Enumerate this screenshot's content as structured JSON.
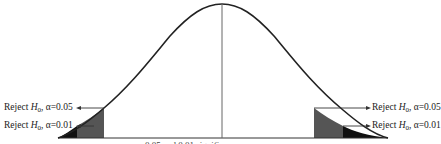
{
  "diagram": {
    "type": "normal-distribution-rejection-regions",
    "colors": {
      "curve": "#222222",
      "center_line": "#555555",
      "region_005": "#555555",
      "region_001": "#111111",
      "arrow": "#333333"
    },
    "left_labels": [
      {
        "prefix": "Reject ",
        "symbol": "H",
        "subscript": "0",
        "alpha_text": ", α=0.05"
      },
      {
        "prefix": "Reject ",
        "symbol": "H",
        "subscript": "0",
        "alpha_text": ", α=0.01"
      }
    ],
    "right_labels": [
      {
        "prefix": "Reject ",
        "symbol": "H",
        "subscript": "0",
        "alpha_text": ", α=0.05"
      },
      {
        "prefix": "Reject ",
        "symbol": "H",
        "subscript": "0",
        "alpha_text": ", α=0.01"
      }
    ],
    "caption_partial": "0.05 and 0.01 significance"
  }
}
